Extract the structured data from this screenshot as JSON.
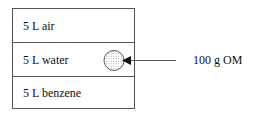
{
  "diagram": {
    "compartments": [
      {
        "label": "5 L air"
      },
      {
        "label": "5 L water"
      },
      {
        "label": "5 L benzene"
      }
    ],
    "input": {
      "label": "100 g OM",
      "target_compartment": "5 L water",
      "symbol": "dotted-circle"
    }
  }
}
